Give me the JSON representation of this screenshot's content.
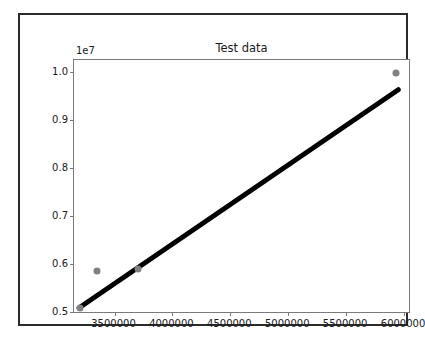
{
  "figure": {
    "title": "Test data",
    "background_color": "#ffffff",
    "frame_color": "#2b2b2b",
    "axes_background": "#ffffff",
    "spine_color": "#7a7a7a"
  },
  "chart_data": {
    "type": "scatter",
    "title": "Test data",
    "xlabel": "",
    "ylabel": "",
    "y_offset_text": "1e7",
    "y_offset_multiplier": 10000000,
    "grid": false,
    "legend": null,
    "xlim": [
      3150000,
      6060000
    ],
    "ylim": [
      4950000,
      10250000
    ],
    "xticks": [
      3500000,
      4000000,
      4500000,
      5000000,
      5500000,
      6000000
    ],
    "xtick_labels": [
      "3500000",
      "4000000",
      "4500000",
      "5000000",
      "5500000",
      "6000000"
    ],
    "yticks": [
      5000000,
      6000000,
      7000000,
      8000000,
      9000000,
      10000000
    ],
    "ytick_labels": [
      "0.5",
      "0.6",
      "0.7",
      "0.8",
      "0.9",
      "1.0"
    ],
    "series": [
      {
        "name": "data points",
        "type": "scatter",
        "color": "#808080",
        "marker": "circle",
        "marker_size": 7,
        "points": [
          {
            "x": 3200000,
            "y": 5070000
          },
          {
            "x": 3350000,
            "y": 5850000
          },
          {
            "x": 3700000,
            "y": 5880000
          },
          {
            "x": 5930000,
            "y": 9980000
          }
        ]
      },
      {
        "name": "fit line",
        "type": "line",
        "color": "#000000",
        "line_width": 5,
        "points": [
          {
            "x": 3195000,
            "y": 5080000
          },
          {
            "x": 5950000,
            "y": 9630000
          }
        ]
      }
    ]
  }
}
